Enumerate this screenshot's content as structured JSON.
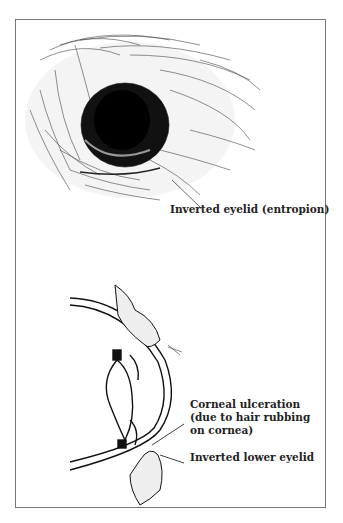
{
  "figure": {
    "top_illustration": "dog eye with inverted eyelid hair",
    "bottom_illustration": "cross-section of eye with inverted lower eyelid",
    "labels": {
      "entropion": "Inverted eyelid (entropion)",
      "ulcer_line1": "Corneal ulceration",
      "ulcer_line2": "(due to hair rubbing",
      "ulcer_line3": "on cornea)",
      "lower_lid": "Inverted lower eyelid"
    }
  }
}
